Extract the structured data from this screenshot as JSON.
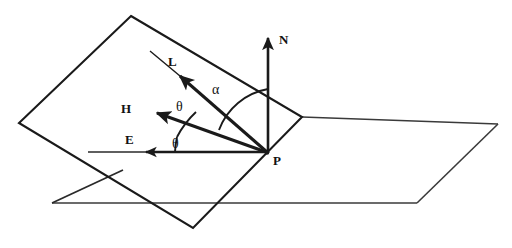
{
  "figure": {
    "type": "geometry-diagram",
    "background_color": "#ffffff",
    "stroke_color": "#1a1a1a"
  },
  "labels": {
    "normal_vector": "N",
    "light_vector": "L",
    "halfway_vector": "H",
    "eye_vector": "E",
    "point": "P",
    "angle_alpha": "α",
    "angle_theta_upper": "θ",
    "angle_theta_lower": "θ"
  },
  "geometry": {
    "origin_point": {
      "name": "P",
      "x": 267,
      "y": 153
    },
    "tilted_plane": {
      "name": "surface-plane",
      "points": "131,16 302,117 193,228 19,123"
    },
    "ground_plane": {
      "name": "reference-plane",
      "top_edge": "302,117 498,124",
      "right_edge": "498,124 417,203",
      "bottom_edge": "417,203 52,203",
      "left_edge": "52,203 131,166"
    },
    "vectors": [
      {
        "name": "N",
        "label": "N",
        "tip_x": 268,
        "tip_y": 36,
        "tail_x": 268,
        "tail_y": 153,
        "label_x": 279,
        "label_y": 43
      },
      {
        "name": "L",
        "label": "L",
        "tip_x": 174,
        "tip_y": 71,
        "tail_x": 267,
        "tail_y": 152,
        "label_x": 172,
        "label_y": 64,
        "extension_x": 152,
        "extension_y": 53
      },
      {
        "name": "H",
        "label": "H",
        "tip_x": 152,
        "tip_y": 112,
        "tail_x": 266,
        "tail_y": 152,
        "label_x": 127,
        "label_y": 112
      },
      {
        "name": "E",
        "label": "E",
        "tip_x": 140,
        "tip_y": 152,
        "tail_x": 266,
        "tail_y": 152,
        "label_x": 130,
        "label_y": 143,
        "extension_x": 88,
        "extension_y": 152
      }
    ],
    "arcs": [
      {
        "name": "alpha-arc",
        "from_vector": "N",
        "to_vector": "L",
        "radius": 64,
        "label_x": 215,
        "label_y": 93
      },
      {
        "name": "theta-arc-upper",
        "from_vector": "L",
        "to_vector": "H",
        "radius": 92,
        "label_x": 179,
        "label_y": 110
      },
      {
        "name": "theta-arc-lower",
        "from_vector": "H",
        "to_vector": "E",
        "radius": 92,
        "label_x": 175,
        "label_y": 147
      }
    ]
  }
}
